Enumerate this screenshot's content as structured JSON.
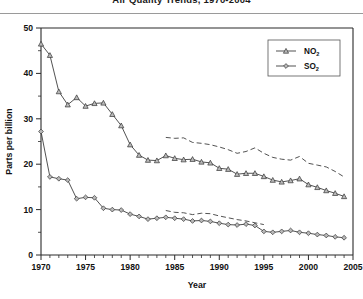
{
  "title": "Air Quality Trends, 1970-2004",
  "axis": {
    "xlabel": "Year",
    "ylabel": "Parts per billion",
    "xticks": [
      "1970",
      "1975",
      "1980",
      "1985",
      "1990",
      "1995",
      "2000",
      "2005"
    ],
    "yticks": [
      "0",
      "10",
      "20",
      "30",
      "40",
      "50"
    ]
  },
  "legend": {
    "items": [
      {
        "key": "no2",
        "label": "NO",
        "sub": "2",
        "marker": "triangle-up"
      },
      {
        "key": "so2",
        "label": "SO",
        "sub": "2",
        "marker": "diamond"
      }
    ]
  },
  "chart_data": {
    "type": "line",
    "title": "Air Quality Trends, 1970-2004",
    "xlabel": "Year",
    "ylabel": "Parts per billion",
    "xlim": [
      1970,
      2005
    ],
    "ylim": [
      0,
      50
    ],
    "grid": false,
    "legend_position": "top-right",
    "x": [
      1970,
      1971,
      1972,
      1973,
      1974,
      1975,
      1976,
      1977,
      1978,
      1979,
      1980,
      1981,
      1982,
      1983,
      1984,
      1985,
      1986,
      1987,
      1988,
      1989,
      1990,
      1991,
      1992,
      1993,
      1994,
      1995,
      1996,
      1997,
      1998,
      1999,
      2000,
      2001,
      2002,
      2003,
      2004
    ],
    "series": [
      {
        "name": "NO2",
        "style": "solid-markers",
        "marker": "triangle-up",
        "values": [
          46.5,
          44.0,
          36.0,
          33.1,
          34.7,
          32.8,
          33.4,
          33.5,
          31.0,
          28.5,
          24.3,
          22.0,
          20.9,
          20.8,
          21.9,
          21.3,
          21.0,
          21.1,
          20.5,
          20.3,
          19.1,
          18.9,
          17.8,
          18.0,
          18.0,
          17.3,
          16.5,
          16.1,
          16.4,
          16.8,
          15.5,
          14.9,
          14.2,
          13.6,
          12.9
        ]
      },
      {
        "name": "SO2",
        "style": "solid-markers",
        "marker": "diamond",
        "values": [
          27.2,
          17.2,
          16.8,
          16.5,
          12.4,
          12.7,
          12.6,
          10.3,
          10.0,
          9.9,
          9.0,
          8.5,
          7.9,
          8.1,
          8.3,
          8.1,
          7.9,
          7.5,
          7.6,
          7.4,
          7.0,
          6.7,
          6.6,
          6.8,
          6.5,
          5.2,
          5.0,
          5.2,
          5.4,
          5.0,
          4.8,
          4.5,
          4.3,
          4.0,
          3.8
        ]
      },
      {
        "name": "NO2 upper bound",
        "style": "dashed",
        "marker": "none",
        "x": [
          1984,
          1985,
          1986,
          1987,
          1988,
          1989,
          1990,
          1991,
          1992,
          1993,
          1994,
          1995,
          1996,
          1997,
          1998,
          1999,
          2000,
          2001,
          2002,
          2003,
          2004
        ],
        "values": [
          25.9,
          25.7,
          25.8,
          24.8,
          24.6,
          24.3,
          23.8,
          23.2,
          22.4,
          22.8,
          23.6,
          22.4,
          21.5,
          21.1,
          20.9,
          21.7,
          20.2,
          19.8,
          19.4,
          18.4,
          17.2
        ]
      },
      {
        "name": "SO2 upper bound",
        "style": "dashed",
        "marker": "none",
        "x": [
          1984,
          1985,
          1986,
          1987,
          1988,
          1989,
          1990,
          1991,
          1992,
          1993,
          1994,
          1995
        ],
        "values": [
          9.8,
          9.4,
          9.3,
          8.9,
          9.2,
          9.1,
          8.6,
          8.2,
          7.8,
          7.5,
          7.1,
          6.7
        ]
      }
    ]
  }
}
